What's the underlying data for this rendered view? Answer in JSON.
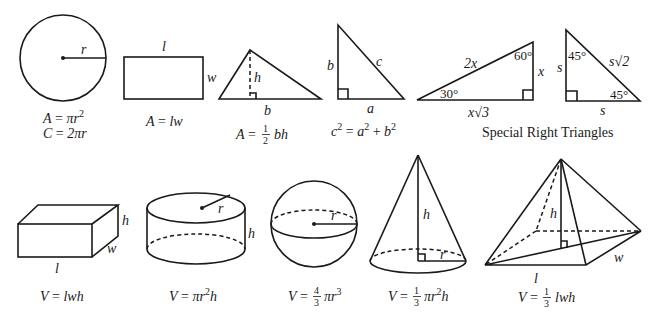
{
  "labels": {
    "circle_r": "r",
    "rect_l": "l",
    "rect_w": "w",
    "tri_h": "h",
    "tri_b": "b",
    "rt_b": "b",
    "rt_c": "c",
    "rt_a": "a",
    "t30_hyp": "2x",
    "t30_angle60": "60°",
    "t30_angle30": "30°",
    "t30_x": "x",
    "t30_base": "x√3",
    "t45_s_left": "s",
    "t45_angle_top": "45°",
    "t45_hyp": "s√2",
    "t45_angle_bottom": "45°",
    "t45_s_bottom": "s",
    "box_h": "h",
    "box_w": "w",
    "box_l": "l",
    "cyl_r": "r",
    "cyl_h": "h",
    "sphere_r": "r",
    "cone_h": "h",
    "cone_r": "r",
    "pyr_h": "h",
    "pyr_l": "l",
    "pyr_w": "w"
  },
  "formulas": {
    "circle_area": {
      "lhs": "A",
      "rhs": "πr",
      "exp": "2"
    },
    "circle_circ": {
      "lhs": "C",
      "rhs": "2πr"
    },
    "rect_area": {
      "lhs": "A",
      "rhs": "lw"
    },
    "tri_area": {
      "lhs": "A",
      "num": "1",
      "den": "2",
      "rhs": "bh"
    },
    "pythag": {
      "c": "c",
      "a": "a",
      "b": "b",
      "exp": "2"
    },
    "box_vol": {
      "lhs": "V",
      "rhs": "lwh"
    },
    "cyl_vol": {
      "lhs": "V",
      "rhs_a": "πr",
      "exp": "2",
      "rhs_b": "h"
    },
    "sphere_vol": {
      "lhs": "V",
      "num": "4",
      "den": "3",
      "rhs": "πr",
      "exp": "3"
    },
    "cone_vol": {
      "lhs": "V",
      "num": "1",
      "den": "3",
      "rhs_a": "πr",
      "exp": "2",
      "rhs_b": "h"
    },
    "pyr_vol": {
      "lhs": "V",
      "num": "1",
      "den": "3",
      "rhs": "lwh"
    }
  },
  "captions": {
    "special_right_triangles": "Special Right Triangles"
  },
  "colors": {
    "stroke": "#1a1a1a",
    "background": "#ffffff"
  }
}
